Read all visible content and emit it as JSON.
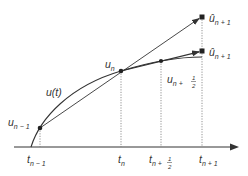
{
  "diagram": {
    "colors": {
      "ink": "#333333",
      "dotted": "#777777",
      "background": "#ffffff"
    },
    "curve_label": {
      "main": "u",
      "arg": "(t)"
    },
    "points": {
      "u_prev": {
        "base": "u",
        "sub": "n − 1"
      },
      "u_n": {
        "base": "u",
        "sub": "n"
      },
      "u_half": {
        "base": "u",
        "sub": "n + ",
        "frac_num": "1",
        "frac_den": "2"
      },
      "u_hat_top": {
        "base": "û",
        "sub": "n + 1"
      },
      "u_hat_low": {
        "base": "û",
        "sub": "n + 1"
      }
    },
    "ticks": {
      "t_prev": {
        "base": "t",
        "sub": "n − 1"
      },
      "t_n": {
        "base": "t",
        "sub": "n"
      },
      "t_half": {
        "base": "t",
        "sub": "n + ",
        "frac_num": "1",
        "frac_den": "2"
      },
      "t_next": {
        "base": "t",
        "sub": "n + 1"
      }
    }
  }
}
